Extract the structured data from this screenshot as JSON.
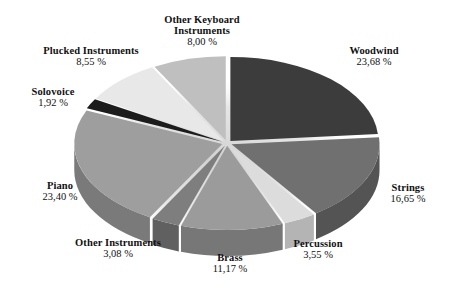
{
  "chart_data": {
    "type": "pie",
    "title": "",
    "subtitle": "",
    "xlabel": "",
    "ylabel": "",
    "style": "3d-exploded-pie",
    "value_suffix": " %",
    "decimal_separator": ",",
    "legend": "none-labels-outside",
    "grid": false,
    "categories": [
      "Woodwind",
      "Strings",
      "Percussion",
      "Brass",
      "Other Instruments",
      "Piano",
      "Solovoice",
      "Plucked Instruments",
      "Other Keyboard Instruments"
    ],
    "values": [
      23.68,
      16.65,
      3.55,
      11.17,
      3.08,
      23.4,
      1.92,
      8.55,
      8.0
    ],
    "value_labels": [
      "23,68 %",
      "16,65 %",
      "3,55 %",
      "11,17 %",
      "3,08 %",
      "23,40 %",
      "1,92 %",
      "8,55 %",
      "8,00 %"
    ],
    "colors": [
      "#3c3c3c",
      "#707070",
      "#dcdcdc",
      "#9b9b9b",
      "#7e7e7e",
      "#9e9e9e",
      "#1c1c1c",
      "#e8e8e8",
      "#bfbfbf"
    ],
    "slices": [
      {
        "label": "Woodwind",
        "value": 23.68,
        "value_label": "23,68 %",
        "color": "#3c3c3c",
        "side_color": "#2a2a2a"
      },
      {
        "label": "Strings",
        "value": 16.65,
        "value_label": "16,65 %",
        "color": "#707070",
        "side_color": "#545454"
      },
      {
        "label": "Percussion",
        "value": 3.55,
        "value_label": "3,55 %",
        "color": "#dcdcdc",
        "side_color": "#b4b4b4"
      },
      {
        "label": "Brass",
        "value": 11.17,
        "value_label": "11,17 %",
        "color": "#9b9b9b",
        "side_color": "#777777"
      },
      {
        "label": "Other Instruments",
        "value": 3.08,
        "value_label": "3,08 %",
        "color": "#7e7e7e",
        "side_color": "#606060"
      },
      {
        "label": "Piano",
        "value": 23.4,
        "value_label": "23,40 %",
        "color": "#9e9e9e",
        "side_color": "#7a7a7a"
      },
      {
        "label": "Solovoice",
        "value": 1.92,
        "value_label": "1,92 %",
        "color": "#1c1c1c",
        "side_color": "#141414"
      },
      {
        "label": "Plucked Instruments",
        "value": 8.55,
        "value_label": "8,55 %",
        "color": "#e8e8e8",
        "side_color": "#c0c0c0"
      },
      {
        "label": "Other Keyboard Instruments",
        "value": 8.0,
        "value_label": "8,00 %",
        "color": "#bfbfbf",
        "side_color": "#989898"
      }
    ]
  },
  "labels": {
    "other_keyboard": {
      "line1": "Other Keyboard",
      "line2": "Instruments",
      "percent": "8,00 %"
    },
    "woodwind": {
      "line1": "Woodwind",
      "line2": "",
      "percent": "23,68 %"
    },
    "strings": {
      "line1": "Strings",
      "line2": "",
      "percent": "16,65 %"
    },
    "percussion": {
      "line1": "Percussion",
      "line2": "",
      "percent": "3,55 %"
    },
    "brass": {
      "line1": "Brass",
      "line2": "",
      "percent": "11,17 %"
    },
    "other_instr": {
      "line1": "Other Instruments",
      "line2": "",
      "percent": "3,08 %"
    },
    "piano": {
      "line1": "Piano",
      "line2": "",
      "percent": "23,40 %"
    },
    "solovoice": {
      "line1": "Solovoice",
      "line2": "",
      "percent": "1,92 %"
    },
    "plucked": {
      "line1": "Plucked Instruments",
      "line2": "",
      "percent": "8,55 %"
    }
  }
}
